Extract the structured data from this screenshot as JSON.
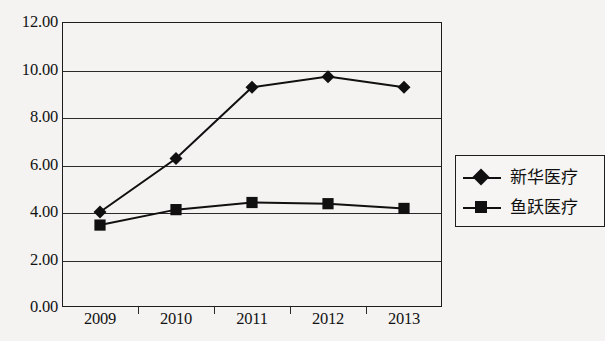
{
  "chart_data": {
    "type": "line",
    "title": "",
    "subtitle": "",
    "xlabel": "",
    "ylabel": "",
    "categories": [
      "2009",
      "2010",
      "2011",
      "2012",
      "2013"
    ],
    "ylim": [
      0,
      12
    ],
    "ytick_step": 2,
    "ytick_labels": [
      "12.00",
      "10.00",
      "8.00",
      "6.00",
      "4.00",
      "2.00",
      "0.00"
    ],
    "ytick_values": [
      12,
      10,
      8,
      6,
      4,
      2,
      0
    ],
    "grid": true,
    "grid_axis": "y",
    "legend_position": "right",
    "series": [
      {
        "name": "新华医疗",
        "marker": "diamond",
        "color": "#101010",
        "values": [
          4.0,
          6.25,
          9.25,
          9.7,
          9.25
        ]
      },
      {
        "name": "鱼跃医疗",
        "marker": "square",
        "color": "#101010",
        "values": [
          3.45,
          4.1,
          4.4,
          4.35,
          4.15
        ]
      }
    ]
  },
  "legend": {
    "items": [
      {
        "label": "新华医疗",
        "marker": "diamond-marker-icon"
      },
      {
        "label": "鱼跃医疗",
        "marker": "square-marker-icon"
      }
    ]
  },
  "colors": {
    "background": "#f4f3f1",
    "axis": "#1d1d1d",
    "grid": "#2a2a2a",
    "series": "#101010"
  }
}
